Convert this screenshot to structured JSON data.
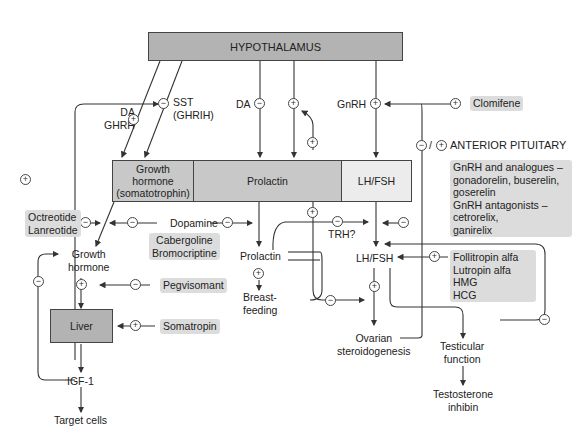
{
  "diagram": {
    "nodes": {
      "hypothalamus": "HYPOTHALAMUS",
      "growth_hormone_box": [
        "Growth",
        "hormone",
        "(somatotrophin)"
      ],
      "prolactin_box": "Prolactin",
      "lhfsh_box": "LH/FSH",
      "anterior_pituitary": "ANTERIOR PITUITARY",
      "growth_hormone": [
        "Growth",
        "hormone"
      ],
      "liver": "Liver",
      "igf1": "IGF-1",
      "target_cells": "Target cells",
      "prolactin": "Prolactin",
      "breastfeeding": [
        "Breast-",
        "feeding"
      ],
      "trh": "TRH?",
      "lhfsh": "LH/FSH",
      "ovarian": [
        "Ovarian",
        "steroidogenesis"
      ],
      "testicular": [
        "Testicular",
        "function"
      ],
      "testosterone": [
        "Testosterone",
        "inhibin"
      ]
    },
    "signals": {
      "da_ghrh": [
        "DA",
        "GHRH"
      ],
      "sst": [
        "SST",
        "(GHRIH)"
      ],
      "da": "DA",
      "gnrh": "GnRH",
      "dopamine": "Dopamine"
    },
    "drugs": {
      "clomifene": "Clomifene",
      "gnrh_analogues": [
        "GnRH and analogues –",
        "gonadorelin, buserelin,",
        "goserelin",
        "GnRH antagonists –",
        "cetrorelix,",
        "ganirelix"
      ],
      "octreotide": [
        "Octreotide",
        "Lanreotide"
      ],
      "cabergoline": [
        "Cabergoline",
        "Bromocriptine"
      ],
      "pegvisomant": "Pegvisomant",
      "somatropin": "Somatropin",
      "follitropin": [
        "Follitropin alfa",
        "Lutropin alfa",
        "HMG",
        "HCG"
      ]
    },
    "symbols": {
      "plus": "+",
      "minus": "−",
      "slash": "/"
    },
    "colors": {
      "dark_box": "#b3b3b3",
      "mid_box": "#c8c8c8",
      "light_box": "#ececec",
      "drug_bg": "#dcdcdc",
      "line": "#333333"
    }
  }
}
